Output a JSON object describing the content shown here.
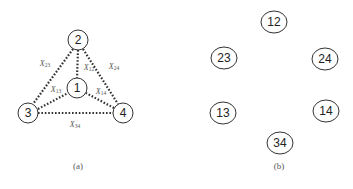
{
  "panel_a": {
    "caption": "(a)",
    "nodes": [
      {
        "id": "1",
        "label": "1",
        "x": 77,
        "y": 88
      },
      {
        "id": "2",
        "label": "2",
        "x": 78,
        "y": 40
      },
      {
        "id": "3",
        "label": "3",
        "x": 28,
        "y": 113
      },
      {
        "id": "4",
        "label": "4",
        "x": 123,
        "y": 113
      }
    ],
    "edges": [
      {
        "from": "2",
        "to": "3",
        "label_main": "X",
        "label_sub": "23"
      },
      {
        "from": "2",
        "to": "1",
        "label_main": "X",
        "label_sub": "12"
      },
      {
        "from": "2",
        "to": "4",
        "label_main": "X",
        "label_sub": "24"
      },
      {
        "from": "3",
        "to": "1",
        "label_main": "X",
        "label_sub": "13"
      },
      {
        "from": "4",
        "to": "1",
        "label_main": "X",
        "label_sub": "14"
      },
      {
        "from": "3",
        "to": "4",
        "label_main": "X",
        "label_sub": "34"
      }
    ]
  },
  "panel_b": {
    "caption": "(b)",
    "nodes": [
      {
        "id": "12",
        "label": "12"
      },
      {
        "id": "23",
        "label": "23"
      },
      {
        "id": "24",
        "label": "24"
      },
      {
        "id": "13",
        "label": "13"
      },
      {
        "id": "14",
        "label": "14"
      },
      {
        "id": "34",
        "label": "34"
      }
    ]
  }
}
